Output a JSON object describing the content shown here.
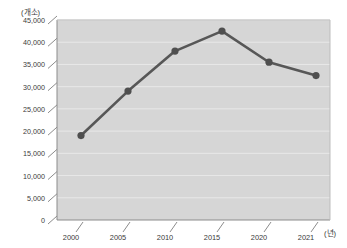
{
  "chart_data": {
    "type": "line",
    "title": "",
    "subtitle": "",
    "xlabel": "(년)",
    "ylabel": "(개소)",
    "x": [
      2002,
      2007,
      2012,
      2017,
      2022,
      2023
    ],
    "values": [
      19000,
      29000,
      38000,
      42500,
      35500,
      32500
    ],
    "series": [
      {
        "name": "개소 수",
        "values": [
          19000,
          29000,
          38000,
          42500,
          35500,
          32500
        ]
      }
    ],
    "ylim": [
      0,
      45000
    ],
    "ytick_labels": [
      "0",
      "5,000",
      "10,000",
      "15,000",
      "20,000",
      "25,000",
      "30,000",
      "35,000",
      "40,000",
      "45,000"
    ],
    "ytick_values": [
      0,
      5000,
      10000,
      15000,
      20000,
      25000,
      30000,
      35000,
      40000,
      45000
    ],
    "xtick_labels": [
      "2000",
      "2005",
      "2010",
      "2015",
      "2020",
      "2021"
    ],
    "xtick_positions": [
      81,
      128,
      175,
      222,
      269,
      316
    ],
    "grid": true,
    "legend": false,
    "legend_position": "none",
    "annotations": [],
    "colors": {
      "line": "#575757",
      "marker": "#4f4f4f",
      "plot_background": "#d6d6d6",
      "gridline": "#e8e8e8",
      "axis": "#8c8c8c",
      "text": "#3a3a3a",
      "page_background": "#ffffff"
    }
  },
  "axes": {
    "y_unit_label": "(개소)",
    "x_unit_label": "(년)"
  }
}
